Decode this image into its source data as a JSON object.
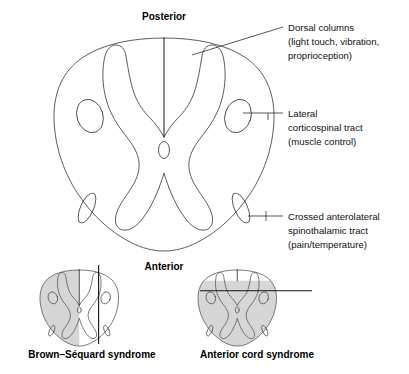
{
  "figure": {
    "orientation": {
      "posterior": "Posterior",
      "anterior": "Anterior"
    },
    "annotations": [
      {
        "id": "dorsal-columns",
        "line1": "Dorsal columns",
        "line2": "(light touch, vibration,",
        "line3": "proprioception)"
      },
      {
        "id": "lateral-corticospinal-tract",
        "line1": "Lateral",
        "line2": "corticospinal tract",
        "line3": "(muscle control)"
      },
      {
        "id": "crossed-anterolateral-spinothalamic-tract",
        "line1": "Crossed anterolateral",
        "line2": "spinothalamic tract",
        "line3": "(pain/temperature)"
      }
    ],
    "syndromes": [
      {
        "id": "brown-sequard",
        "caption": "Brown–Séquard syndrome",
        "lesion": "hemisection",
        "shaded_side": "left"
      },
      {
        "id": "anterior-cord",
        "caption": "Anterior cord syndrome",
        "lesion": "anterior-two-thirds",
        "shaded_side": "anterior"
      }
    ],
    "colors": {
      "outline": "#4a4a4a",
      "shading": "#d6d6d6",
      "text": "#000000",
      "leader": "#3a3a3a",
      "background": "#ffffff"
    }
  }
}
